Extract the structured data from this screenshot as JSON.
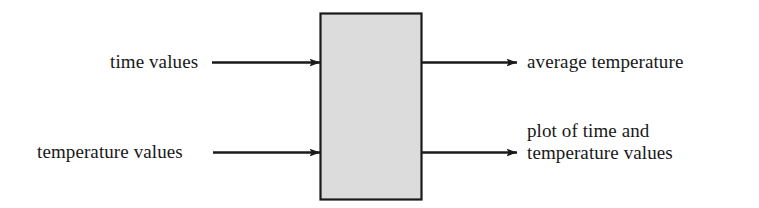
{
  "diagram": {
    "type": "black-box-process-diagram",
    "title": "",
    "process_box": {
      "name": "process-box",
      "fill_color": "#dcdcdc",
      "border_color": "#1a1a1a",
      "label": "",
      "x": 320,
      "y": 13,
      "width": 102,
      "height": 187
    },
    "inputs": [
      {
        "id": "time-values",
        "label": "time values",
        "arrow_name": "input-arrow-time-values"
      },
      {
        "id": "temperature-values",
        "label": "temperature values",
        "arrow_name": "input-arrow-temperature-values"
      }
    ],
    "outputs": [
      {
        "id": "average-temperature",
        "label": "average temperature",
        "arrow_name": "output-arrow-average-temperature"
      },
      {
        "id": "plot-of-time-and-temperature-values",
        "label_line1": "plot of time and",
        "label_line2": "temperature values",
        "arrow_name": "output-arrow-plot"
      }
    ],
    "colors": {
      "background": "#ffffff",
      "line": "#1a1a1a",
      "box_fill": "#dcdcdc",
      "text": "#181818"
    }
  }
}
